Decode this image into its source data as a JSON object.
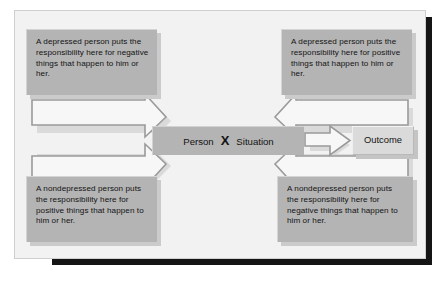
{
  "diagram": {
    "center": {
      "left_label": "Person",
      "operator": "X",
      "right_label": "Situation"
    },
    "outcome": {
      "label": "Outcome"
    },
    "notes": [
      {
        "position": "top-left",
        "text": "A depressed person puts the responsibility here for negative things that happen to him or her."
      },
      {
        "position": "top-right",
        "text": "A depressed person puts the responsibility here for positive things that happen to him or her."
      },
      {
        "position": "bottom-left",
        "text": "A nondepressed person puts the responsibility here for positive things that happen to him or her."
      },
      {
        "position": "bottom-right",
        "text": "A nondepressed person puts the responsibility here for negative things that happen to him or her."
      }
    ],
    "colors": {
      "panel_background": "#f2f2f2",
      "note_fill": "#b4b4b4",
      "center_fill": "#b4b4b4",
      "outcome_fill": "#dadada",
      "arrow_fill": "#f7f7f7",
      "arrow_outline": "#9a9a9a",
      "frame_shadow": "#151515",
      "text": "#131313"
    }
  }
}
